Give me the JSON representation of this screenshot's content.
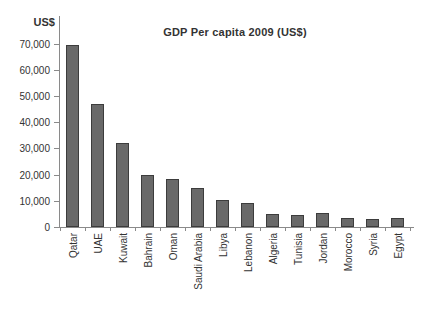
{
  "chart_data": {
    "type": "bar",
    "title": "GDP Per capita 2009 (US$)",
    "y_unit_label": "US$",
    "categories": [
      "Qatar",
      "UAE",
      "Kuwait",
      "Bahrain",
      "Oman",
      "Saudi Arabia",
      "Libya",
      "Lebanon",
      "Algeria",
      "Tunisia",
      "Jordan",
      "Morocco",
      "Syria",
      "Egypt"
    ],
    "values": [
      69500,
      47000,
      32000,
      19800,
      18300,
      14900,
      10300,
      9200,
      5000,
      4600,
      5500,
      3400,
      3000,
      3300
    ],
    "xlabel": "",
    "ylabel": "US$",
    "ylim": [
      0,
      70000
    ],
    "ytick_interval": 10000,
    "ytick_labels": [
      "0",
      "10,000",
      "20,000",
      "30,000",
      "40,000",
      "50,000",
      "60,000",
      "70,000"
    ],
    "grid": false,
    "legend": "none",
    "bar_color": "#696969",
    "bar_border_color": "#3c3c3c",
    "axis_color": "#8a8a8a",
    "text_color": "#333333",
    "background_color": "#ffffff"
  }
}
